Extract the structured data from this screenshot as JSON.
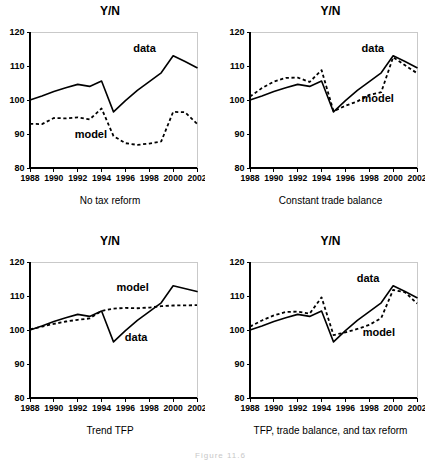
{
  "figure": {
    "caption": "Figure 11.6",
    "axis_title": "Y/N",
    "series_labels": {
      "data": "data",
      "model": "model"
    }
  },
  "chart_data": [
    {
      "type": "line",
      "title": "Y/N",
      "xlabel": "No tax reform",
      "ylabel": "Y/N",
      "panel_id": "no-tax-reform",
      "grid": false,
      "legend": "inline-annotations",
      "xlim": [
        1988,
        2002
      ],
      "ylim": [
        80,
        120
      ],
      "yticks": [
        80,
        90,
        100,
        110,
        120
      ],
      "xticks": [
        1988,
        1990,
        1992,
        1994,
        1996,
        1998,
        2000,
        2002
      ],
      "x": [
        1988,
        1989,
        1990,
        1991,
        1992,
        1993,
        1994,
        1995,
        1996,
        1997,
        1998,
        1999,
        2000,
        2001,
        2002
      ],
      "series": [
        {
          "name": "data",
          "style": "solid",
          "values": [
            100.0,
            101.2,
            102.5,
            103.6,
            104.6,
            104.0,
            105.6,
            96.5,
            99.8,
            102.8,
            105.4,
            108.0,
            113.0,
            111.3,
            109.5
          ],
          "label_x": 1997.6,
          "label_y": 114.1
        },
        {
          "name": "model",
          "style": "dashed",
          "values": [
            93.0,
            92.9,
            94.7,
            94.6,
            94.9,
            94.3,
            97.5,
            89.4,
            87.3,
            86.8,
            87.2,
            87.8,
            96.5,
            96.4,
            93.0
          ],
          "label_x": 1993.1,
          "label_y": 88.8
        }
      ]
    },
    {
      "type": "line",
      "title": "Y/N",
      "xlabel": "Constant trade balance",
      "ylabel": "Y/N",
      "panel_id": "constant-trade-balance",
      "grid": false,
      "legend": "inline-annotations",
      "xlim": [
        1988,
        2002
      ],
      "ylim": [
        80,
        120
      ],
      "yticks": [
        80,
        90,
        100,
        110,
        120
      ],
      "xticks": [
        1988,
        1990,
        1992,
        1994,
        1996,
        1998,
        2000,
        2002
      ],
      "x": [
        1988,
        1989,
        1990,
        1991,
        1992,
        1993,
        1994,
        1995,
        1996,
        1997,
        1998,
        1999,
        2000,
        2001,
        2002
      ],
      "series": [
        {
          "name": "data",
          "style": "solid",
          "values": [
            100.0,
            101.2,
            102.5,
            103.6,
            104.6,
            104.0,
            105.6,
            96.5,
            99.8,
            102.8,
            105.4,
            108.0,
            113.0,
            111.3,
            109.5
          ],
          "label_x": 1998.3,
          "label_y": 114.0
        },
        {
          "name": "model",
          "style": "dashed",
          "values": [
            101.0,
            103.5,
            105.4,
            106.5,
            106.6,
            105.3,
            108.8,
            96.7,
            98.3,
            99.6,
            101.5,
            102.3,
            112.6,
            110.2,
            107.9
          ],
          "label_x": 1998.7,
          "label_y": 99.3
        }
      ]
    },
    {
      "type": "line",
      "title": "Y/N",
      "xlabel": "Trend TFP",
      "ylabel": "Y/N",
      "panel_id": "trend-tfp",
      "grid": false,
      "legend": "inline-annotations",
      "xlim": [
        1988,
        2002
      ],
      "ylim": [
        80,
        120
      ],
      "yticks": [
        80,
        90,
        100,
        110,
        120
      ],
      "xticks": [
        1988,
        1990,
        1992,
        1994,
        1996,
        1998,
        2000,
        2002
      ],
      "x": [
        1988,
        1989,
        1990,
        1991,
        1992,
        1993,
        1994,
        1995,
        1996,
        1997,
        1998,
        1999,
        2000,
        2002
      ],
      "series": [
        {
          "name": "data",
          "style": "solid",
          "values": [
            100.0,
            101.2,
            102.5,
            103.6,
            104.6,
            104.0,
            105.6,
            96.5,
            99.8,
            102.8,
            105.4,
            108.0,
            113.0,
            111.3,
            109.5
          ],
          "label_x": 1996.9,
          "label_y": 96.9
        },
        {
          "name": "model",
          "style": "dashed",
          "values": [
            100.2,
            101.0,
            101.8,
            102.5,
            103.0,
            103.4,
            105.6,
            106.3,
            106.5,
            106.4,
            106.6,
            107.0,
            107.2,
            107.3,
            107.6
          ],
          "label_x": 1996.6,
          "label_y": 111.5
        }
      ]
    },
    {
      "type": "line",
      "title": "Y/N",
      "xlabel": "TFP, trade balance, and tax reform",
      "ylabel": "Y/N",
      "panel_id": "tfp-trade-balance-tax-reform",
      "grid": false,
      "legend": "inline-annotations",
      "xlim": [
        1988,
        2002
      ],
      "ylim": [
        80,
        120
      ],
      "yticks": [
        80,
        90,
        100,
        110,
        120
      ],
      "xticks": [
        1988,
        1990,
        1992,
        1994,
        1996,
        1998,
        2000,
        2002
      ],
      "x": [
        1988,
        1989,
        1990,
        1991,
        1992,
        1993,
        1994,
        1995,
        1996,
        1997,
        1998,
        1999,
        2000,
        2001,
        2002
      ],
      "series": [
        {
          "name": "data",
          "style": "solid",
          "values": [
            100.0,
            101.2,
            102.5,
            103.6,
            104.6,
            104.0,
            105.6,
            96.5,
            99.8,
            102.8,
            105.4,
            108.0,
            113.0,
            111.3,
            109.5
          ],
          "label_x": 1997.9,
          "label_y": 114.2
        },
        {
          "name": "model",
          "style": "dashed",
          "values": [
            101.0,
            102.8,
            104.3,
            105.3,
            105.4,
            104.8,
            109.6,
            98.5,
            99.3,
            100.3,
            101.5,
            103.5,
            111.8,
            111.1,
            107.8
          ],
          "label_x": 1998.8,
          "label_y": 98.2
        }
      ]
    }
  ]
}
